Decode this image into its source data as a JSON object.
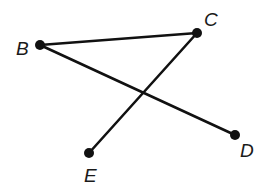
{
  "diagram": {
    "type": "line-segments",
    "colors": {
      "line": "#111111",
      "point": "#111111",
      "label": "#1a1a1a",
      "background": "#ffffff"
    },
    "points": [
      {
        "name": "B",
        "x": 40,
        "y": 45,
        "label_x": 16,
        "label_y": 55
      },
      {
        "name": "C",
        "x": 197,
        "y": 33,
        "label_x": 204,
        "label_y": 26
      },
      {
        "name": "D",
        "x": 235,
        "y": 135,
        "label_x": 240,
        "label_y": 157
      },
      {
        "name": "E",
        "x": 89,
        "y": 153,
        "label_x": 84,
        "label_y": 182
      }
    ],
    "segments": [
      {
        "name": "BC",
        "from": "B",
        "to": "C"
      },
      {
        "name": "BD",
        "from": "B",
        "to": "D"
      },
      {
        "name": "CE",
        "from": "C",
        "to": "E"
      }
    ]
  }
}
